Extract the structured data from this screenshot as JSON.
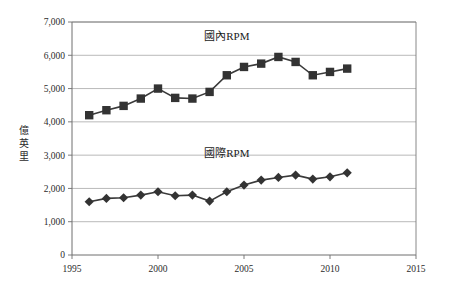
{
  "chart_data": {
    "type": "line",
    "title": "",
    "xlabel": "",
    "ylabel": "億英里",
    "xlim": [
      1995,
      2015
    ],
    "ylim": [
      0,
      7000
    ],
    "xticks": [
      "1995",
      "2000",
      "2005",
      "2010",
      "2015"
    ],
    "yticks": [
      "0",
      "1,000",
      "2,000",
      "3,000",
      "4,000",
      "5,000",
      "6,000",
      "7,000"
    ],
    "grid": true,
    "legend_position": "inline-annotation",
    "annotations": [
      {
        "text": "國內RPM",
        "series": "domestic",
        "x": 2004.0,
        "y": 6450
      },
      {
        "text": "國際RPM",
        "series": "international",
        "x": 2004.0,
        "y": 2950
      }
    ],
    "x": [
      1996,
      1997,
      1998,
      1999,
      2000,
      2001,
      2002,
      2003,
      2004,
      2005,
      2006,
      2007,
      2008,
      2009,
      2010,
      2011
    ],
    "series": [
      {
        "name": "國內RPM",
        "marker": "square",
        "color": "#333333",
        "values": [
          4200,
          4350,
          4480,
          4700,
          5000,
          4720,
          4700,
          4900,
          5400,
          5650,
          5750,
          5950,
          5800,
          5400,
          5500,
          5600
        ]
      },
      {
        "name": "國際RPM",
        "marker": "diamond",
        "color": "#333333",
        "values": [
          1600,
          1700,
          1720,
          1800,
          1900,
          1780,
          1800,
          1620,
          1900,
          2100,
          2250,
          2330,
          2400,
          2280,
          2350,
          2470
        ]
      }
    ]
  },
  "caption": {
    "text": ""
  }
}
